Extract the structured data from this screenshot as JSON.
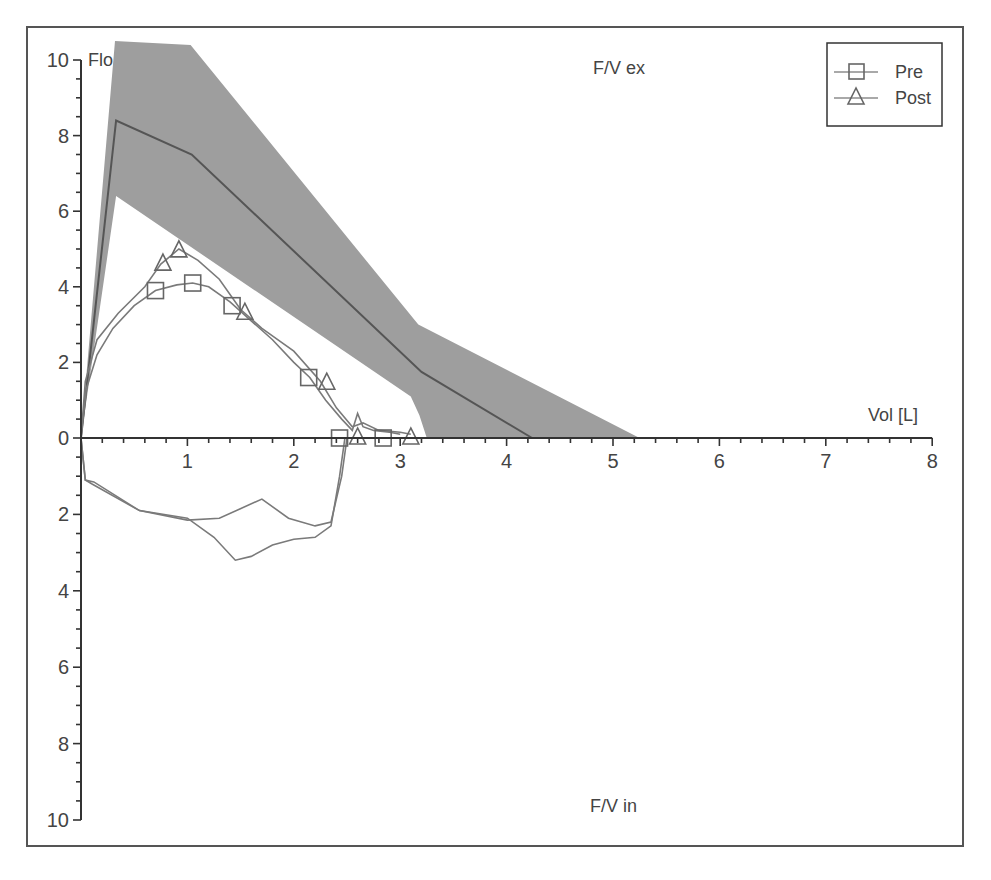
{
  "chart_data": {
    "type": "line",
    "title_top": "F/V ex",
    "title_bottom": "F/V in",
    "ylabel": "Flow",
    "ylabel_visible": "Flo",
    "xlabel": "Vol [L]",
    "xlim": [
      0,
      8
    ],
    "ylim_expiratory": [
      0,
      10
    ],
    "ylim_inspiratory": [
      0,
      10
    ],
    "x_ticks": [
      "1",
      "2",
      "3",
      "4",
      "5",
      "6",
      "7",
      "8"
    ],
    "y_ticks_expiratory": [
      "0",
      "2",
      "4",
      "6",
      "8",
      "10"
    ],
    "y_ticks_inspiratory": [
      "2",
      "4",
      "6",
      "8",
      "10"
    ],
    "grid": false,
    "legend": {
      "placement": "top-right",
      "entries": [
        {
          "name": "Pre",
          "marker": "square"
        },
        {
          "name": "Post",
          "marker": "triangle"
        }
      ]
    },
    "colors": {
      "band": "#9e9e9e",
      "predicted": "#555555",
      "curves": "#7a7a7a",
      "frame": "#555555"
    },
    "predicted_band": {
      "name": "Normal range",
      "upper": [
        [
          0,
          0
        ],
        [
          0.32,
          10.5
        ],
        [
          1.03,
          10.4
        ],
        [
          3.17,
          3.0
        ],
        [
          5.25,
          0
        ]
      ],
      "lower": [
        [
          0,
          0
        ],
        [
          0.33,
          6.4
        ],
        [
          3.1,
          1.1
        ],
        [
          3.18,
          0.6
        ],
        [
          3.25,
          0
        ]
      ]
    },
    "predicted_line": {
      "name": "Predicted",
      "points": [
        [
          0,
          0
        ],
        [
          0.33,
          8.4
        ],
        [
          1.04,
          7.5
        ],
        [
          3.2,
          1.75
        ],
        [
          4.24,
          0
        ]
      ]
    },
    "series": [
      {
        "name": "Pre",
        "marker": "square",
        "expiratory": [
          [
            0,
            0
          ],
          [
            0.05,
            1.3
          ],
          [
            0.15,
            2.2
          ],
          [
            0.3,
            2.9
          ],
          [
            0.5,
            3.5
          ],
          [
            0.7,
            3.9
          ],
          [
            0.9,
            4.05
          ],
          [
            1.05,
            4.1
          ],
          [
            1.2,
            4.0
          ],
          [
            1.4,
            3.6
          ],
          [
            1.6,
            3.1
          ],
          [
            1.8,
            2.6
          ],
          [
            2.0,
            2.0
          ],
          [
            2.15,
            1.6
          ],
          [
            2.3,
            1.0
          ],
          [
            2.45,
            0.5
          ],
          [
            2.55,
            0.2
          ],
          [
            2.6,
            0.65
          ],
          [
            2.65,
            0.3
          ],
          [
            2.75,
            0.2
          ],
          [
            2.9,
            0.15
          ],
          [
            3.0,
            0.1
          ]
        ],
        "markers_exp": [
          [
            0.7,
            3.9
          ],
          [
            1.05,
            4.1
          ],
          [
            1.42,
            3.5
          ],
          [
            2.14,
            1.6
          ],
          [
            2.43,
            0
          ],
          [
            2.84,
            0
          ]
        ],
        "inspiratory": [
          [
            0,
            0
          ],
          [
            0.04,
            1.1
          ],
          [
            0.1,
            1.2
          ],
          [
            0.55,
            1.9
          ],
          [
            1.0,
            2.1
          ],
          [
            1.25,
            2.6
          ],
          [
            1.45,
            3.2
          ],
          [
            1.6,
            3.1
          ],
          [
            1.8,
            2.8
          ],
          [
            2.0,
            2.65
          ],
          [
            2.2,
            2.6
          ],
          [
            2.35,
            2.3
          ],
          [
            2.43,
            1.0
          ],
          [
            2.48,
            0
          ]
        ]
      },
      {
        "name": "Post",
        "marker": "triangle",
        "expiratory": [
          [
            0,
            0
          ],
          [
            0.04,
            1.5
          ],
          [
            0.15,
            2.6
          ],
          [
            0.35,
            3.3
          ],
          [
            0.6,
            4.0
          ],
          [
            0.75,
            4.6
          ],
          [
            0.92,
            5.0
          ],
          [
            1.1,
            4.7
          ],
          [
            1.3,
            4.2
          ],
          [
            1.5,
            3.4
          ],
          [
            1.7,
            2.9
          ],
          [
            2.0,
            2.3
          ],
          [
            2.25,
            1.5
          ],
          [
            2.4,
            0.8
          ],
          [
            2.55,
            0.3
          ],
          [
            2.65,
            0.4
          ],
          [
            2.8,
            0.2
          ],
          [
            3.0,
            0.15
          ],
          [
            3.1,
            0.1
          ]
        ],
        "markers_exp": [
          [
            0.77,
            4.6
          ],
          [
            0.92,
            4.95
          ],
          [
            1.54,
            3.3
          ],
          [
            2.31,
            1.45
          ],
          [
            2.6,
            0
          ],
          [
            3.1,
            0
          ]
        ],
        "inspiratory": [
          [
            0,
            0
          ],
          [
            0.04,
            1.1
          ],
          [
            0.12,
            1.15
          ],
          [
            0.55,
            1.9
          ],
          [
            1.0,
            2.15
          ],
          [
            1.3,
            2.1
          ],
          [
            1.7,
            1.6
          ],
          [
            1.95,
            2.1
          ],
          [
            2.2,
            2.3
          ],
          [
            2.35,
            2.2
          ],
          [
            2.45,
            1.0
          ],
          [
            2.5,
            0
          ]
        ]
      }
    ]
  }
}
